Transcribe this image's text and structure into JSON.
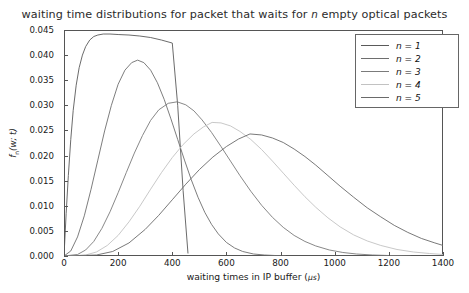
{
  "chart_data": {
    "type": "line",
    "title": "waiting time distributions for packet that waits for n empty optical packets",
    "title_pre": "waiting time distributions for packet that waits for ",
    "title_var": "n",
    "title_post": " empty optical packets",
    "xlabel": "waiting times in IP buffer (",
    "xlabel_unit": "μs",
    "xlabel_close": ")",
    "ylabel": "f",
    "ylabel_sub": "n",
    "ylabel_arg": "(w; t)",
    "xlim": [
      0,
      1400
    ],
    "ylim": [
      0.0,
      0.045
    ],
    "xticks": [
      0,
      200,
      400,
      600,
      800,
      1000,
      1200,
      1400
    ],
    "xticklabels": [
      "0",
      "200",
      "400",
      "600",
      "800",
      "1000",
      "1200",
      "1400"
    ],
    "yticks": [
      0.0,
      0.005,
      0.01,
      0.015,
      0.02,
      0.025,
      0.03,
      0.035,
      0.04,
      0.045
    ],
    "yticklabels": [
      "0.000",
      "0.005",
      "0.010",
      "0.015",
      "0.020",
      "0.025",
      "0.030",
      "0.035",
      "0.040",
      "0.045"
    ],
    "grid": false,
    "legend_position": "upper right",
    "series": [
      {
        "name": "n = 1",
        "label_var": "n",
        "label_eq": " = ",
        "label_val": "1",
        "color": "#5a5a5a",
        "peak_x": 150,
        "peak_y": 0.0442,
        "truncated_at_x": 458,
        "points": [
          [
            0,
            0.0
          ],
          [
            8,
            0.0085
          ],
          [
            16,
            0.016
          ],
          [
            25,
            0.0232
          ],
          [
            34,
            0.029
          ],
          [
            45,
            0.034
          ],
          [
            56,
            0.0375
          ],
          [
            68,
            0.04
          ],
          [
            80,
            0.0417
          ],
          [
            95,
            0.043
          ],
          [
            110,
            0.0437
          ],
          [
            125,
            0.044
          ],
          [
            145,
            0.0442
          ],
          [
            170,
            0.0442
          ],
          [
            200,
            0.0441
          ],
          [
            240,
            0.044
          ],
          [
            280,
            0.0438
          ],
          [
            320,
            0.0435
          ],
          [
            360,
            0.043
          ],
          [
            400,
            0.0424
          ],
          [
            420,
            0.03
          ],
          [
            440,
            0.013
          ],
          [
            458,
            0.0005
          ]
        ]
      },
      {
        "name": "n = 2",
        "label_var": "n",
        "label_eq": " = ",
        "label_val": "2",
        "color": "#6e6e6e",
        "peak_x": 272,
        "peak_y": 0.039,
        "points": [
          [
            0,
            0.0
          ],
          [
            25,
            0.001
          ],
          [
            50,
            0.0038
          ],
          [
            75,
            0.008
          ],
          [
            100,
            0.0133
          ],
          [
            125,
            0.0191
          ],
          [
            150,
            0.0249
          ],
          [
            175,
            0.03
          ],
          [
            200,
            0.0342
          ],
          [
            225,
            0.037
          ],
          [
            250,
            0.0385
          ],
          [
            272,
            0.039
          ],
          [
            295,
            0.0385
          ],
          [
            320,
            0.037
          ],
          [
            345,
            0.0345
          ],
          [
            370,
            0.0312
          ],
          [
            395,
            0.0273
          ],
          [
            420,
            0.0232
          ],
          [
            445,
            0.0191
          ],
          [
            470,
            0.0152
          ],
          [
            495,
            0.0117
          ],
          [
            520,
            0.0087
          ],
          [
            545,
            0.0063
          ],
          [
            570,
            0.0044
          ],
          [
            600,
            0.0027
          ],
          [
            630,
            0.0016
          ],
          [
            660,
            0.0009
          ],
          [
            700,
            0.0004
          ],
          [
            740,
            0.0002
          ],
          [
            780,
            0.0001
          ],
          [
            820,
            0.0
          ]
        ]
      },
      {
        "name": "n = 3",
        "label_var": "n",
        "label_eq": " = ",
        "label_val": "3",
        "color": "#7b7b7b",
        "peak_x": 418,
        "peak_y": 0.0307,
        "points": [
          [
            0,
            0.0
          ],
          [
            50,
            0.0003
          ],
          [
            80,
            0.0012
          ],
          [
            110,
            0.0029
          ],
          [
            140,
            0.0055
          ],
          [
            170,
            0.0088
          ],
          [
            200,
            0.0126
          ],
          [
            230,
            0.0166
          ],
          [
            260,
            0.0205
          ],
          [
            290,
            0.024
          ],
          [
            320,
            0.027
          ],
          [
            350,
            0.0291
          ],
          [
            385,
            0.0304
          ],
          [
            418,
            0.0307
          ],
          [
            450,
            0.0301
          ],
          [
            480,
            0.0289
          ],
          [
            510,
            0.0271
          ],
          [
            545,
            0.0246
          ],
          [
            580,
            0.0218
          ],
          [
            615,
            0.0189
          ],
          [
            650,
            0.016
          ],
          [
            690,
            0.0129
          ],
          [
            730,
            0.0101
          ],
          [
            770,
            0.0077
          ],
          [
            810,
            0.0057
          ],
          [
            850,
            0.0041
          ],
          [
            890,
            0.0029
          ],
          [
            930,
            0.002
          ],
          [
            980,
            0.0012
          ],
          [
            1030,
            0.0007
          ],
          [
            1080,
            0.0004
          ],
          [
            1140,
            0.0002
          ],
          [
            1200,
            0.0001
          ],
          [
            1280,
            0.0
          ]
        ]
      },
      {
        "name": "n = 4",
        "label_var": "n",
        "label_eq": " = ",
        "label_val": "4",
        "color": "#c2c2c2",
        "peak_x": 547,
        "peak_y": 0.0266,
        "points": [
          [
            0,
            0.0
          ],
          [
            80,
            0.0002
          ],
          [
            120,
            0.0008
          ],
          [
            160,
            0.0021
          ],
          [
            200,
            0.0041
          ],
          [
            240,
            0.0068
          ],
          [
            280,
            0.0099
          ],
          [
            320,
            0.0133
          ],
          [
            360,
            0.0166
          ],
          [
            400,
            0.0196
          ],
          [
            440,
            0.0222
          ],
          [
            480,
            0.0243
          ],
          [
            515,
            0.0257
          ],
          [
            547,
            0.0266
          ],
          [
            580,
            0.0265
          ],
          [
            615,
            0.0259
          ],
          [
            650,
            0.0248
          ],
          [
            690,
            0.0232
          ],
          [
            730,
            0.0212
          ],
          [
            770,
            0.0189
          ],
          [
            810,
            0.0165
          ],
          [
            850,
            0.0141
          ],
          [
            890,
            0.0118
          ],
          [
            930,
            0.0097
          ],
          [
            975,
            0.0076
          ],
          [
            1020,
            0.0058
          ],
          [
            1070,
            0.0042
          ],
          [
            1120,
            0.003
          ],
          [
            1170,
            0.0021
          ],
          [
            1230,
            0.0013
          ],
          [
            1290,
            0.0008
          ],
          [
            1350,
            0.0005
          ],
          [
            1400,
            0.0003
          ]
        ]
      },
      {
        "name": "n = 5",
        "label_var": "n",
        "label_eq": " = ",
        "label_val": "5",
        "color": "#6a6a6a",
        "peak_x": 687,
        "peak_y": 0.0243,
        "points": [
          [
            0,
            0.0
          ],
          [
            120,
            0.0002
          ],
          [
            180,
            0.0009
          ],
          [
            240,
            0.0026
          ],
          [
            300,
            0.0053
          ],
          [
            350,
            0.0081
          ],
          [
            400,
            0.0112
          ],
          [
            450,
            0.0143
          ],
          [
            500,
            0.0172
          ],
          [
            550,
            0.0197
          ],
          [
            600,
            0.0218
          ],
          [
            645,
            0.0233
          ],
          [
            687,
            0.0243
          ],
          [
            730,
            0.0241
          ],
          [
            770,
            0.0235
          ],
          [
            810,
            0.0226
          ],
          [
            850,
            0.0213
          ],
          [
            890,
            0.0198
          ],
          [
            930,
            0.0181
          ],
          [
            975,
            0.016
          ],
          [
            1020,
            0.0139
          ],
          [
            1070,
            0.0117
          ],
          [
            1120,
            0.0096
          ],
          [
            1170,
            0.0078
          ],
          [
            1220,
            0.0061
          ],
          [
            1270,
            0.0047
          ],
          [
            1320,
            0.0035
          ],
          [
            1370,
            0.0026
          ],
          [
            1400,
            0.0021
          ]
        ]
      }
    ]
  }
}
